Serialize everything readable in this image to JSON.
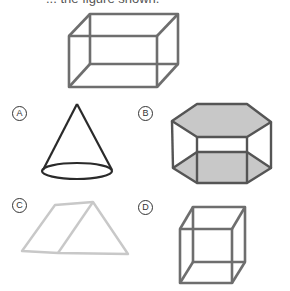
{
  "prompt": {
    "text": "... the figure shown."
  },
  "question_figure": {
    "shape": "rectangular-prism",
    "color": "#6e6e6e"
  },
  "options": [
    {
      "letter": "A",
      "shape": "cone",
      "stroke": "#2a2a2a"
    },
    {
      "letter": "B",
      "shape": "hexagonal-prism",
      "stroke": "#555555",
      "fill": "#c8c8c8"
    },
    {
      "letter": "C",
      "shape": "triangular-prism-faded",
      "stroke": "#c8c8c8"
    },
    {
      "letter": "D",
      "shape": "rectangular-prism-tall",
      "stroke": "#6e6e6e"
    }
  ]
}
